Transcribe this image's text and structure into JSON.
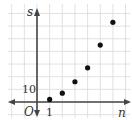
{
  "chart_data": {
    "type": "scatter",
    "title": "",
    "xlabel": "n",
    "ylabel": "s",
    "origin_label": "O",
    "x_tick_labels": [
      "1"
    ],
    "y_tick_labels": [
      "10"
    ],
    "x": [
      1,
      2,
      3,
      4,
      5,
      6
    ],
    "series": [
      {
        "name": "s",
        "values": [
          2,
          7,
          16,
          27,
          45,
          63
        ]
      }
    ],
    "xlim": [
      -5,
      7
    ],
    "ylim": [
      -10,
      80
    ],
    "grid": true,
    "x_grid_step": 1,
    "y_grid_step": 10,
    "legend": "none"
  },
  "colors": {
    "grid": "#d9d9d9",
    "axis": "#444444",
    "point": "#111111"
  }
}
